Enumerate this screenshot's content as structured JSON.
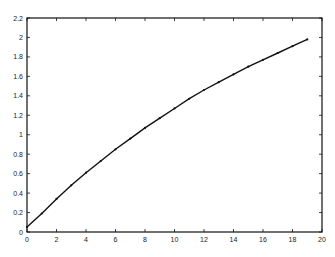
{
  "chart_data": {
    "type": "line",
    "title": "",
    "xlabel": "",
    "ylabel": "",
    "xlim": [
      0,
      20
    ],
    "ylim": [
      0,
      2.2
    ],
    "grid": false,
    "legend": null,
    "x_ticks": [
      "0",
      "2",
      "4",
      "6",
      "8",
      "10",
      "12",
      "14",
      "16",
      "18",
      "20"
    ],
    "y_ticks": [
      "0",
      "0.2",
      "0.4",
      "0.6",
      "0.8",
      "1",
      "1.2",
      "1.4",
      "1.6",
      "1.8",
      "2",
      "2.2"
    ],
    "series": [
      {
        "name": "curve",
        "color": "#111111",
        "marker": "dot",
        "x": [
          0,
          1,
          2,
          3,
          4,
          5,
          6,
          7,
          8,
          9,
          10,
          11,
          12,
          13,
          14,
          15,
          16,
          17,
          18,
          19
        ],
        "values": [
          0.05,
          0.19,
          0.34,
          0.48,
          0.61,
          0.73,
          0.85,
          0.96,
          1.07,
          1.17,
          1.27,
          1.37,
          1.46,
          1.54,
          1.62,
          1.7,
          1.77,
          1.84,
          1.91,
          1.98
        ]
      }
    ]
  }
}
